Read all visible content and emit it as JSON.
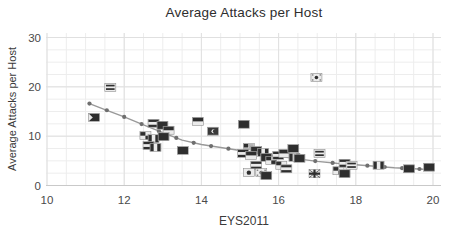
{
  "title": "Average Attacks per Host",
  "axes": {
    "xlabel": "EYS2011",
    "ylabel": "Average Attacks per Host"
  },
  "colors": {
    "background": "#ffffff",
    "grid_minor": "#ededed",
    "grid_major": "#e0e0e0",
    "axis_line": "#c9c9c9",
    "trend_line": "#999999",
    "trend_marker": "#6f6f6f",
    "flag_dark": "#2e2e2e",
    "flag_light": "#ebebeb",
    "text": "#4a4a4a"
  },
  "chart_data": {
    "type": "scatter",
    "title": "Average Attacks per Host",
    "xlabel": "EYS2011",
    "ylabel": "Average Attacks per Host",
    "xlim": [
      10,
      20
    ],
    "ylim": [
      0,
      30
    ],
    "x_ticks": [
      10,
      12,
      14,
      16,
      18,
      20
    ],
    "y_ticks": [
      0,
      10,
      20,
      30
    ],
    "grid": "fine light-gray grid, minor x every 0.5, minor y every 2.5, majors at labeled ticks",
    "legend": "none",
    "marker_style": "tiny grayscale country-flag icons",
    "points": [
      {
        "x": 11.22,
        "y": 13.8,
        "flag": "chevron"
      },
      {
        "x": 11.64,
        "y": 19.9,
        "flag": "hbar"
      },
      {
        "x": 12.76,
        "y": 12.6,
        "flag": "hstripes"
      },
      {
        "x": 12.99,
        "y": 12.2,
        "flag": "dark"
      },
      {
        "x": 13.15,
        "y": 11.2,
        "flag": "band"
      },
      {
        "x": 12.55,
        "y": 10.1,
        "flag": "checker"
      },
      {
        "x": 12.76,
        "y": 9.5,
        "flag": "vstripes"
      },
      {
        "x": 13.02,
        "y": 9.9,
        "flag": "dark"
      },
      {
        "x": 12.63,
        "y": 8.1,
        "flag": "hstripes"
      },
      {
        "x": 12.81,
        "y": 7.7,
        "flag": "vstripes"
      },
      {
        "x": 13.52,
        "y": 7.1,
        "flag": "dark"
      },
      {
        "x": 13.91,
        "y": 13.0,
        "flag": "band"
      },
      {
        "x": 14.3,
        "y": 11.0,
        "flag": "crescent"
      },
      {
        "x": 15.1,
        "y": 12.4,
        "flag": "dark"
      },
      {
        "x": 15.23,
        "y": 7.7,
        "flag": "canton"
      },
      {
        "x": 15.42,
        "y": 7.1,
        "flag": "dark"
      },
      {
        "x": 15.08,
        "y": 6.5,
        "flag": "hstripes"
      },
      {
        "x": 15.29,
        "y": 6.1,
        "flag": "band"
      },
      {
        "x": 15.6,
        "y": 6.7,
        "flag": "vstripes"
      },
      {
        "x": 15.68,
        "y": 5.7,
        "flag": "dark"
      },
      {
        "x": 15.81,
        "y": 5.1,
        "flag": "checker"
      },
      {
        "x": 15.99,
        "y": 6.1,
        "flag": "hstripes"
      },
      {
        "x": 16.15,
        "y": 6.5,
        "flag": "band"
      },
      {
        "x": 16.38,
        "y": 7.5,
        "flag": "dark"
      },
      {
        "x": 16.41,
        "y": 5.7,
        "flag": "vstripes"
      },
      {
        "x": 16.54,
        "y": 5.5,
        "flag": "dark"
      },
      {
        "x": 15.42,
        "y": 4.1,
        "flag": "hstripes"
      },
      {
        "x": 15.23,
        "y": 2.6,
        "flag": "circle"
      },
      {
        "x": 15.55,
        "y": 2.6,
        "flag": "emblem"
      },
      {
        "x": 15.68,
        "y": 2.0,
        "flag": "dark"
      },
      {
        "x": 16.07,
        "y": 4.1,
        "flag": "checker"
      },
      {
        "x": 16.2,
        "y": 3.4,
        "flag": "hstripes"
      },
      {
        "x": 16.98,
        "y": 21.9,
        "flag": "emblem"
      },
      {
        "x": 17.06,
        "y": 6.5,
        "flag": "hbar"
      },
      {
        "x": 16.93,
        "y": 2.4,
        "flag": "cross"
      },
      {
        "x": 17.55,
        "y": 3.0,
        "flag": "checker"
      },
      {
        "x": 17.71,
        "y": 4.5,
        "flag": "hstripes"
      },
      {
        "x": 17.89,
        "y": 4.1,
        "flag": "hbar"
      },
      {
        "x": 17.71,
        "y": 2.4,
        "flag": "dark"
      },
      {
        "x": 18.59,
        "y": 4.1,
        "flag": "vstripes"
      },
      {
        "x": 19.38,
        "y": 3.4,
        "flag": "dark"
      },
      {
        "x": 19.9,
        "y": 3.7,
        "flag": "dark"
      }
    ],
    "trend": {
      "type": "smoothed fit (loess-like), declining and flattening",
      "line": [
        [
          11.1,
          16.6
        ],
        [
          11.5,
          15.4
        ],
        [
          12.0,
          13.9
        ],
        [
          12.5,
          12.3
        ],
        [
          13.0,
          10.7
        ],
        [
          13.5,
          9.2
        ],
        [
          14.0,
          8.3
        ],
        [
          14.5,
          7.7
        ],
        [
          15.0,
          7.1
        ],
        [
          15.5,
          6.5
        ],
        [
          16.0,
          5.9
        ],
        [
          16.5,
          5.4
        ],
        [
          17.0,
          4.9
        ],
        [
          17.5,
          4.5
        ],
        [
          18.0,
          4.2
        ],
        [
          18.5,
          3.9
        ],
        [
          19.0,
          3.6
        ],
        [
          19.5,
          3.4
        ],
        [
          20.0,
          3.2
        ]
      ],
      "markers": [
        [
          11.1,
          16.6
        ],
        [
          11.55,
          15.25
        ],
        [
          12.0,
          13.9
        ],
        [
          12.45,
          12.46
        ],
        [
          12.9,
          11.02
        ],
        [
          13.35,
          9.65
        ],
        [
          13.8,
          8.66
        ],
        [
          14.25,
          8.0
        ],
        [
          14.7,
          7.46
        ],
        [
          15.15,
          6.92
        ],
        [
          15.6,
          6.38
        ],
        [
          16.05,
          5.85
        ],
        [
          16.5,
          5.4
        ],
        [
          16.95,
          4.95
        ],
        [
          17.4,
          4.58
        ],
        [
          17.85,
          4.29
        ],
        [
          18.3,
          4.02
        ],
        [
          18.75,
          3.75
        ],
        [
          19.2,
          3.52
        ],
        [
          19.65,
          3.34
        ]
      ]
    }
  }
}
